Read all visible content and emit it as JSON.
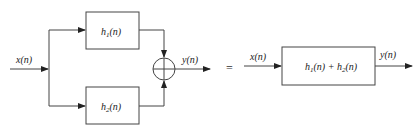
{
  "diagram": {
    "left": {
      "input_label": "x(n)",
      "top_block": {
        "label": "h",
        "sub": "1",
        "arg": "(n)"
      },
      "bottom_block": {
        "label": "h",
        "sub": "2",
        "arg": "(n)"
      },
      "output_label": "y(n)",
      "adder": "summing-junction"
    },
    "equals": "=",
    "right": {
      "input_label": "x(n)",
      "block": {
        "a": "h",
        "a_sub": "1",
        "mid": "(n) + ",
        "b": "h",
        "b_sub": "2",
        "end": "(n)"
      },
      "output_label": "y(n)"
    },
    "colors": {
      "line": "#333333",
      "box_fill": "#ffffff"
    }
  }
}
